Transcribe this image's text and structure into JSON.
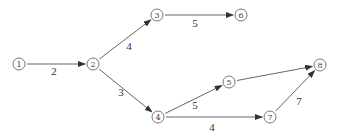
{
  "diagram": {
    "type": "network-graph",
    "colors": {
      "line": "#555555",
      "text": "#333333",
      "background": "#ffffff"
    },
    "nodes": [
      {
        "id": "1",
        "label": "1",
        "x": 19,
        "y": 64
      },
      {
        "id": "2",
        "label": "2",
        "x": 93,
        "y": 64
      },
      {
        "id": "3",
        "label": "3",
        "x": 157,
        "y": 15
      },
      {
        "id": "4",
        "label": "4",
        "x": 158,
        "y": 117
      },
      {
        "id": "5",
        "label": "5",
        "x": 229,
        "y": 82
      },
      {
        "id": "6",
        "label": "6",
        "x": 241,
        "y": 15
      },
      {
        "id": "7",
        "label": "7",
        "x": 270,
        "y": 117
      },
      {
        "id": "8",
        "label": "8",
        "x": 320,
        "y": 65
      }
    ],
    "edges": [
      {
        "from": "1",
        "to": "2",
        "label": "2",
        "lx": 54,
        "ly": 75
      },
      {
        "from": "2",
        "to": "3",
        "label": "4",
        "lx": 129,
        "ly": 50
      },
      {
        "from": "2",
        "to": "4",
        "label": "3",
        "lx": 121,
        "ly": 96
      },
      {
        "from": "3",
        "to": "6",
        "label": "5",
        "lx": 195,
        "ly": 27
      },
      {
        "from": "4",
        "to": "5",
        "label": "5",
        "lx": 195,
        "ly": 109
      },
      {
        "from": "4",
        "to": "7",
        "label": "4",
        "lx": 212,
        "ly": 131
      },
      {
        "from": "5",
        "to": "8",
        "label": "",
        "lx": 0,
        "ly": 0
      },
      {
        "from": "7",
        "to": "8",
        "label": "7",
        "lx": 299,
        "ly": 105
      }
    ]
  }
}
